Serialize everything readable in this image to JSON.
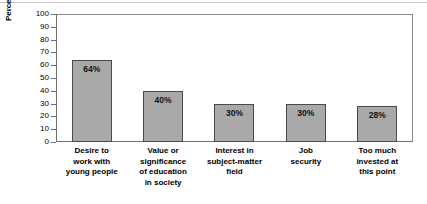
{
  "chart_data": {
    "type": "bar",
    "title": "",
    "xlabel": "",
    "ylabel": "Percentage of teachers",
    "ylim": [
      0,
      100
    ],
    "yticks": [
      100,
      90,
      80,
      70,
      60,
      50,
      40,
      30,
      20,
      10,
      0
    ],
    "grid": false,
    "legend": null,
    "bar_color": "#a9a9a9",
    "bar_edge_color": "#4a4a4a",
    "categories": [
      "Desire to work with young people",
      "Value or significance of education in society",
      "Interest in subject-matter field",
      "Job security",
      "Too much invested at this point"
    ],
    "category_lines": [
      [
        "Desire to",
        "work with",
        "young people"
      ],
      [
        "Value or",
        "significance",
        "of education",
        "in society"
      ],
      [
        "Interest in",
        "subject-matter",
        "field"
      ],
      [
        "Job",
        "security"
      ],
      [
        "Too much",
        "invested at",
        "this point"
      ]
    ],
    "values": [
      64,
      40,
      30,
      30,
      28
    ],
    "value_labels": [
      "64%",
      "40%",
      "30%",
      "30%",
      "28%"
    ]
  }
}
